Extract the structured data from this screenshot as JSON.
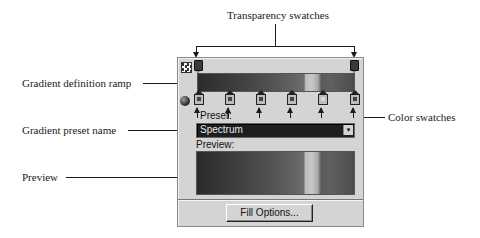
{
  "callouts": {
    "transparency_swatches": "Transparency swatches",
    "gradient_definition_ramp": "Gradient definition ramp",
    "color_swatches": "Color swatches",
    "gradient_preset_name": "Gradient preset name",
    "preview": "Preview"
  },
  "panel": {
    "icons": {
      "checkerboard": "checkerboard-icon",
      "sphere": "sphere-icon",
      "transparency_swatch": "transparency-swatch-icon",
      "color_swatch": "color-swatch-icon"
    },
    "transparency_swatch_count": 2,
    "color_swatch_count": 6,
    "preset_label": "Preset:",
    "preset_value": "Spectrum",
    "preview_label": "Preview:",
    "fill_options_button": "Fill Options..."
  }
}
